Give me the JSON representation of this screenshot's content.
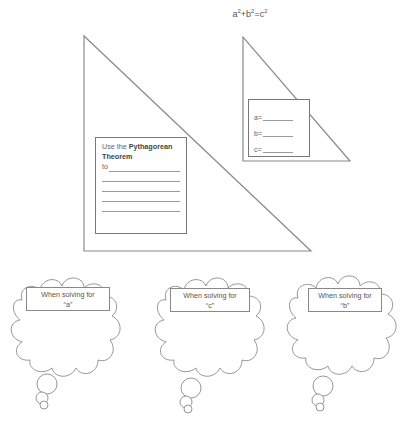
{
  "header": {
    "formula_parts": [
      "a",
      "2",
      "+b",
      "2",
      "=c",
      "2"
    ]
  },
  "big_triangle": {
    "box": {
      "text_prefix": "Use the ",
      "text_bold": "Pythagorean Theorem",
      "to_label": "to",
      "blank_lines": 4
    }
  },
  "small_triangle": {
    "box": {
      "fields": [
        {
          "label": "a="
        },
        {
          "label": "b="
        },
        {
          "label": "c="
        }
      ]
    }
  },
  "clouds": [
    {
      "label_line1": "When solving for",
      "label_line2": "“a”"
    },
    {
      "label_line1": "When solving for",
      "label_line2": "“c”"
    },
    {
      "label_line1": "When solving for",
      "label_line2": "“b”"
    }
  ],
  "colors": {
    "stroke": "#8a8a8a",
    "text": "#555555",
    "background": "#ffffff"
  }
}
